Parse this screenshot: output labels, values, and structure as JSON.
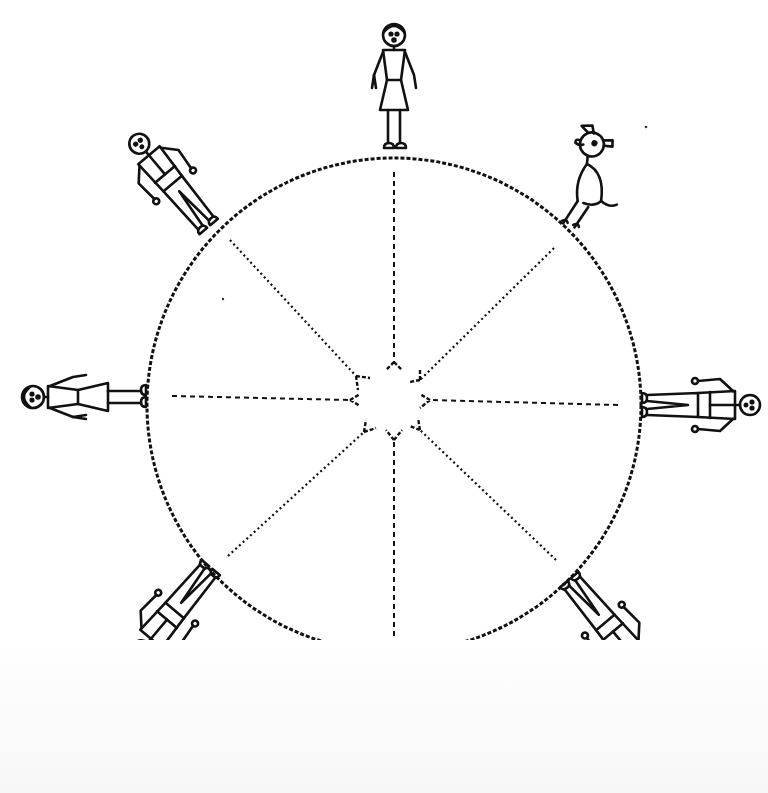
{
  "diagram": {
    "type": "illustration",
    "colors": {
      "ink": "#111111",
      "background": "#ffffff"
    },
    "globe": {
      "center": [
        394,
        405
      ],
      "radius": 247,
      "outline_style": "hand-drawn-dashed"
    },
    "center_burst": {
      "shape": "star",
      "center": [
        394,
        405
      ],
      "outline_style": "dashed"
    },
    "arrows": [
      {
        "from_angle_deg": -90,
        "style": "dashed",
        "points_to": "center"
      },
      {
        "from_angle_deg": -45,
        "style": "dotted",
        "points_to": "center"
      },
      {
        "from_angle_deg": 0,
        "style": "dashed",
        "points_to": "center"
      },
      {
        "from_angle_deg": 45,
        "style": "dotted",
        "points_to": "center"
      },
      {
        "from_angle_deg": 90,
        "style": "dashed",
        "points_to": "center"
      },
      {
        "from_angle_deg": 135,
        "style": "dotted",
        "points_to": "center"
      },
      {
        "from_angle_deg": 180,
        "style": "dashed",
        "points_to": "center"
      },
      {
        "from_angle_deg": -135,
        "style": "dotted",
        "points_to": "center"
      }
    ],
    "figures": [
      {
        "id": "top",
        "kind": "girl-in-dress",
        "angle_deg": -90
      },
      {
        "id": "top-right",
        "kind": "dog",
        "angle_deg": -45
      },
      {
        "id": "right",
        "kind": "man",
        "angle_deg": 0
      },
      {
        "id": "bottom-right",
        "kind": "man",
        "angle_deg": 45
      },
      {
        "id": "bottom",
        "kind": "man",
        "angle_deg": 90
      },
      {
        "id": "bottom-left",
        "kind": "man",
        "angle_deg": 135
      },
      {
        "id": "left",
        "kind": "girl-in-dress",
        "angle_deg": 180
      },
      {
        "id": "top-left",
        "kind": "man",
        "angle_deg": -135
      }
    ]
  }
}
